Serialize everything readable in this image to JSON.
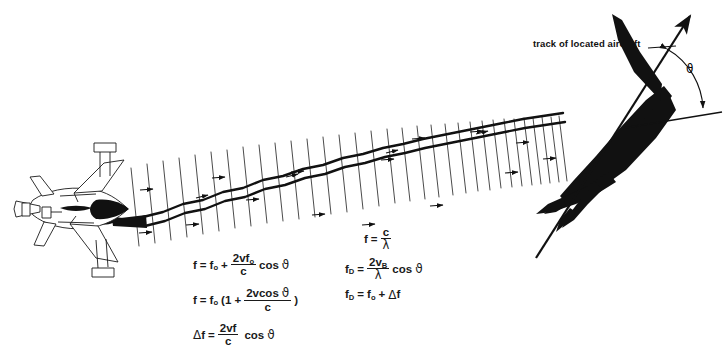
{
  "canvas": {
    "width": 724,
    "height": 358,
    "background": "#ffffff",
    "ink": "#111111"
  },
  "annotations": {
    "track_label": "track of located aircraft",
    "angle_symbol": "ϑ"
  },
  "formulas": {
    "left_column": [
      {
        "id": "doppler-shifted-frequency",
        "parts": {
          "lhs": "f",
          "eq": "=",
          "f0": "f",
          "f0_sub": "o",
          "op": "+",
          "num": "2vf",
          "num_sub": "o",
          "den": "c",
          "trail": "cos",
          "angle": "ϑ"
        }
      },
      {
        "id": "doppler-factored-frequency",
        "parts": {
          "lhs": "f",
          "eq": "=",
          "f0": "f",
          "f0_sub": "o",
          "open": "(1 +",
          "num": "2vcos",
          "num_angle": "ϑ",
          "den": "c",
          "close": ")"
        }
      },
      {
        "id": "frequency-shift",
        "parts": {
          "delta": "Δ",
          "lhs": "f",
          "eq": "=",
          "num": "2vf",
          "den": "c",
          "trail": "cos",
          "angle": "ϑ"
        }
      }
    ],
    "right_column": [
      {
        "id": "frequency-wavelength",
        "parts": {
          "lhs": "f",
          "eq": "=",
          "num": "c",
          "den": "λ"
        }
      },
      {
        "id": "doppler-frequency-velocity",
        "parts": {
          "lhs": "f",
          "lhs_sub": "D",
          "eq": "=",
          "num": "2v",
          "num_sub": "B",
          "den": "λ",
          "trail": "cos",
          "angle": "ϑ"
        }
      },
      {
        "id": "doppler-frequency-sum",
        "parts": {
          "lhs": "f",
          "lhs_sub": "D",
          "eq": "=",
          "f0": "f",
          "f0_sub": "o",
          "op": "+",
          "delta": "Δ",
          "rhs": "f"
        }
      }
    ]
  },
  "graphics": {
    "transmitter_aircraft": "fighter-jet-outline",
    "target_aircraft": "bomber-silhouette",
    "beam": "doppler-wave-beam",
    "wavefronts": "wavefront-tick-lines",
    "track_arrow": "track-direction-arrow",
    "reference_line": "horizontal-reference-line",
    "angle_arc": "angle-arc-indicator"
  }
}
